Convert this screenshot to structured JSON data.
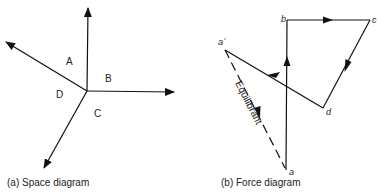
{
  "space_diagram": {
    "caption": "(a) Space diagram",
    "region_labels": {
      "A": "A",
      "B": "B",
      "C": "C",
      "D": "D"
    }
  },
  "force_diagram": {
    "caption": "(b) Force diagram",
    "point_labels": {
      "a": "a",
      "b": "b",
      "c": "c",
      "d": "d",
      "a_prime": "a´"
    },
    "equilibrant_label": "Equilibrant"
  },
  "colors": {
    "line": "#111111",
    "background": "#ffffff"
  }
}
